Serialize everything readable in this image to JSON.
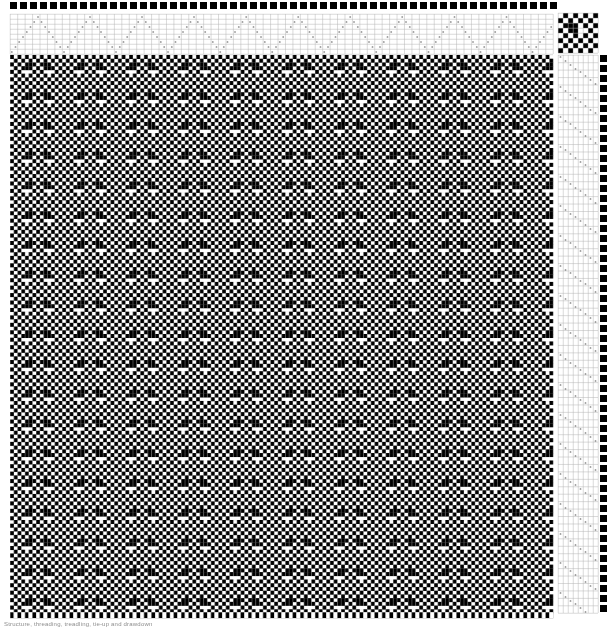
{
  "document": {
    "type": "weaving-draft",
    "title": "Weaving Draft",
    "caption": "Structure, threading, treadling, tie-up and drawdown",
    "background_color": "#ffffff",
    "ink_color": "#000000",
    "grid_line_color": "#b4b4b4",
    "mark_color": "#4a4a4a"
  },
  "layout": {
    "canvas_width": 611,
    "canvas_height": 630,
    "cell": 3.72,
    "warp_color_bar": {
      "x": 10,
      "y": 2,
      "height": 9,
      "square": 7,
      "gap": 3
    },
    "threading": {
      "x": 10,
      "y": 14,
      "width": 543,
      "height": 40,
      "shafts": 8
    },
    "tieup": {
      "x": 558,
      "y": 13,
      "size": 40,
      "rows": 8,
      "cols": 8
    },
    "drawdown": {
      "x": 10,
      "y": 55,
      "width": 543,
      "height": 558
    },
    "treadling": {
      "x": 558,
      "y": 55,
      "width": 40,
      "height": 558,
      "treadles": 8
    },
    "weft_color_bar": {
      "x": 600,
      "y": 55,
      "width": 9,
      "square": 7,
      "gap": 3
    }
  },
  "draft": {
    "shafts": 8,
    "treadles": 8,
    "warp_ends": 146,
    "weft_picks": 150,
    "threading_label": "Threading (8 shafts)",
    "tieup_label": "Tie-up (8x8)",
    "treadling_label": "Treadling (8 treadles)",
    "drawdown_label": "Drawdown",
    "warp_color_label": "Warp colour bar",
    "weft_color_label": "Weft colour bar",
    "threading_pattern_name": "point-twill-zigzag",
    "threading_repeat": [
      1,
      2,
      3,
      4,
      5,
      6,
      7,
      8,
      7,
      6,
      5,
      4,
      3,
      2
    ],
    "treadling_pattern_name": "straight-descending-diagonal",
    "treadling_repeat": [
      1,
      2,
      3,
      4,
      5,
      6,
      7,
      8
    ],
    "tieup_pattern_name": "checkerboard-with-block",
    "tieup_rows": [
      [
        1,
        0,
        1,
        0,
        1,
        0,
        1,
        0
      ],
      [
        0,
        1,
        0,
        1,
        0,
        1,
        0,
        1
      ],
      [
        1,
        0,
        1,
        0,
        1,
        0,
        1,
        0
      ],
      [
        0,
        1,
        0,
        1,
        0,
        1,
        0,
        1
      ],
      [
        1,
        0,
        1,
        1,
        0,
        0,
        1,
        0
      ],
      [
        0,
        1,
        1,
        1,
        0,
        1,
        0,
        1
      ],
      [
        1,
        0,
        1,
        0,
        1,
        0,
        1,
        0
      ],
      [
        0,
        1,
        0,
        1,
        0,
        1,
        0,
        1
      ]
    ],
    "warp_colors": [
      "#000000"
    ],
    "weft_colors": [
      "#000000"
    ],
    "structure_name": "maze-labyrinth-twill"
  },
  "chart_data": {
    "type": "heatmap",
    "xlabel": "Warp ends",
    "ylabel": "Weft picks",
    "grid": true,
    "legend": "none",
    "cols": 146,
    "rows": 150,
    "palette": {
      "0": "#ffffff",
      "1": "#000000"
    }
  }
}
